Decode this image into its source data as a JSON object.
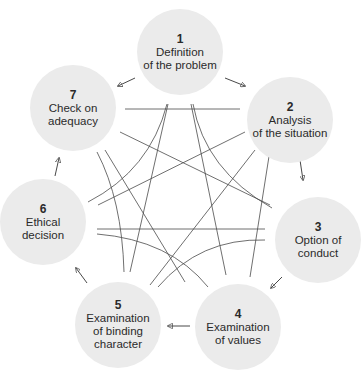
{
  "diagram": {
    "title": "",
    "circle_color": "#ebebeb",
    "line_color": "#4a4a4a",
    "steps": [
      {
        "number": "1",
        "label_line1": "Definition",
        "label_line2": "of the problem",
        "label_line3": ""
      },
      {
        "number": "2",
        "label_line1": "Analysis",
        "label_line2": "of the situation",
        "label_line3": ""
      },
      {
        "number": "3",
        "label_line1": "Option of",
        "label_line2": "conduct",
        "label_line3": ""
      },
      {
        "number": "4",
        "label_line1": "Examination",
        "label_line2": "of values",
        "label_line3": ""
      },
      {
        "number": "5",
        "label_line1": "Examination",
        "label_line2": "of binding",
        "label_line3": "character"
      },
      {
        "number": "6",
        "label_line1": "Ethical",
        "label_line2": "decision",
        "label_line3": ""
      },
      {
        "number": "7",
        "label_line1": "Check on",
        "label_line2": "adequacy",
        "label_line3": ""
      }
    ],
    "flow": [
      "1 → 2",
      "2 → 3",
      "3 → 4",
      "4 → 5",
      "5 → 6",
      "6 → 7",
      "7 → 1"
    ]
  }
}
